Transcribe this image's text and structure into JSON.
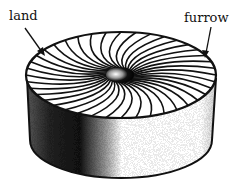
{
  "diagram": {
    "labels": [
      {
        "id": "land",
        "text": "land"
      },
      {
        "id": "furrow",
        "text": "furrow"
      }
    ],
    "colors": {
      "ink": "#111111",
      "background": "#ffffff"
    }
  }
}
